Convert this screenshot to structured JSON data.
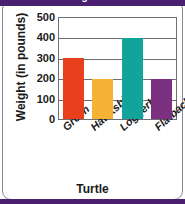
{
  "chart_data": {
    "type": "bar",
    "title": "Maximum Weights of Sea Turtles",
    "xlabel": "Turtle",
    "ylabel": "Weight (in pounds)",
    "categories": [
      "Green",
      "Hawksbill",
      "Loggerhead",
      "Flatback"
    ],
    "values": [
      300,
      200,
      400,
      200
    ],
    "colors": [
      "#E8401C",
      "#F5B335",
      "#12A39A",
      "#7B3080"
    ],
    "ylim": [
      0,
      500
    ],
    "yticks": [
      0,
      100,
      200,
      300,
      400,
      500
    ],
    "ytick_labels": [
      "0",
      "100",
      "200",
      "300",
      "400",
      "500"
    ],
    "grid": "horizontal",
    "legend": "none"
  },
  "frame": {
    "title_band_color": "#4b2070",
    "border_color": "#8b8b97"
  }
}
